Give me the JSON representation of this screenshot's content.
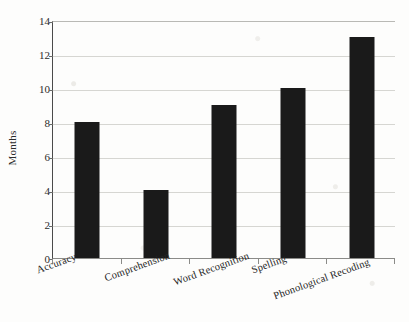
{
  "chart_data": {
    "type": "bar",
    "title": "",
    "xlabel": "",
    "ylabel": "Months",
    "categories": [
      "Accuracy",
      "Comprehension",
      "Word Recognition",
      "Spelling",
      "Phonological Recoding"
    ],
    "values": [
      8,
      4,
      9,
      10,
      13
    ],
    "ylim": [
      0,
      14
    ],
    "ytick_step": 2,
    "yticks": [
      0,
      2,
      4,
      6,
      8,
      10,
      12,
      14
    ],
    "ytick_labels": [
      "0",
      "2",
      "4",
      "6",
      "8",
      "10",
      "12",
      "14"
    ],
    "grid": true,
    "grid_axis": "y",
    "legend": false,
    "bar_color": "#1a1a1a",
    "gridline_color": "#d6d6d2",
    "axis_color": "#4a4a4a",
    "background_color": "#fdfdfc",
    "xtick_label_rotation": -20
  }
}
